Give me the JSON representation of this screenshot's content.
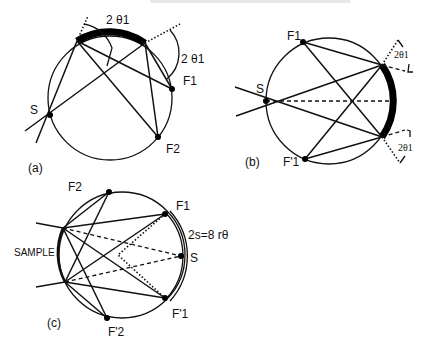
{
  "figure": {
    "panels": [
      {
        "id": "a",
        "caption": "(a)",
        "labels": {
          "source": "S",
          "focus1": "F1",
          "focus2": "F2",
          "angle_top": "2 θ1",
          "angle_right": "2 θ1"
        },
        "circle": {
          "cx": 110,
          "cy": 98,
          "r": 62
        },
        "points": {
          "S": [
            50,
            115
          ],
          "F1": [
            172,
            89
          ],
          "F2": [
            158,
            137
          ],
          "sample_left": [
            77,
            41
          ],
          "sample_right": [
            145,
            43
          ]
        }
      },
      {
        "id": "b",
        "caption": "(b)",
        "labels": {
          "source": "S",
          "focus1": "F1",
          "focus1_prime": "F'1",
          "angle_top": "2θ1",
          "angle_bottom": "2θ1"
        },
        "circle": {
          "cx": 329,
          "cy": 101,
          "r": 63
        },
        "points": {
          "S": [
            266,
            101
          ],
          "F1": [
            303,
            42
          ],
          "F1p": [
            305,
            159
          ],
          "sample_top": [
            382,
            65
          ],
          "sample_bottom": [
            382,
            137
          ]
        }
      },
      {
        "id": "c",
        "caption": "(c)",
        "labels": {
          "source": "S",
          "focus1": "F1",
          "focus1_prime": "F'1",
          "focus2": "F2",
          "focus2_prime": "F'2",
          "sample": "SAMPLE",
          "arc_formula": "2s=8 rθ"
        },
        "circle": {
          "cx": 122,
          "cy": 255,
          "r": 63
        },
        "points": {
          "S": [
            181,
            256
          ],
          "F1": [
            165,
            214
          ],
          "F1p": [
            165,
            298
          ],
          "F2": [
            109,
            192
          ],
          "F2p": [
            107,
            318
          ],
          "sample_top": [
            63,
            228
          ],
          "sample_bottom": [
            65,
            282
          ],
          "apex": [
            118,
            255
          ]
        }
      }
    ]
  }
}
